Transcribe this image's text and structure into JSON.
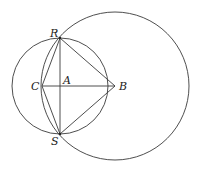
{
  "diagram": {
    "type": "geometry",
    "points": {
      "R": {
        "label": "R",
        "x": 60,
        "y": 38
      },
      "S": {
        "label": "S",
        "x": 60,
        "y": 134
      },
      "C": {
        "label": "C",
        "x": 42,
        "y": 86
      },
      "A": {
        "label": "A",
        "x": 60,
        "y": 86
      },
      "B": {
        "label": "B",
        "x": 115,
        "y": 86
      }
    },
    "circles": [
      {
        "name": "small-circle",
        "cx": 60,
        "cy": 86,
        "r": 48
      },
      {
        "name": "large-circle",
        "cx": 115,
        "cy": 86,
        "r": 74
      }
    ],
    "segments": [
      [
        "C",
        "R"
      ],
      [
        "C",
        "S"
      ],
      [
        "R",
        "B"
      ],
      [
        "S",
        "B"
      ],
      [
        "R",
        "S"
      ],
      [
        "C",
        "B"
      ]
    ],
    "stroke_color": "#3a3a3a"
  }
}
